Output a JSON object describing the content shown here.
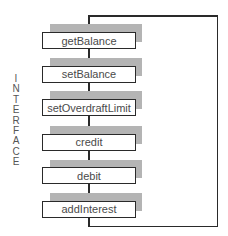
{
  "diagram": {
    "side_label": "INTERFACE",
    "side_letters": [
      "I",
      "N",
      "T",
      "E",
      "R",
      "F",
      "A",
      "C",
      "E"
    ],
    "methods": [
      {
        "label": "getBalance"
      },
      {
        "label": "setBalance"
      },
      {
        "label": "setOverdraftLimit"
      },
      {
        "label": "credit"
      },
      {
        "label": "debit"
      },
      {
        "label": "addInterest"
      }
    ],
    "colors": {
      "line": "#2a2a2a",
      "shadow": "#b4b4b4",
      "text": "#4a4a4a",
      "background": "#ffffff"
    }
  }
}
